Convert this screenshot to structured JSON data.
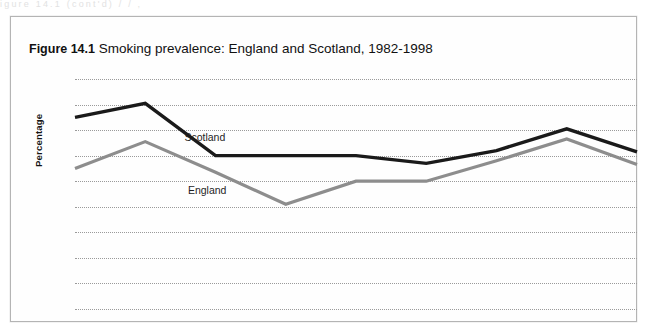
{
  "scan": {
    "top_remnant_text": "igure 14.1  (cont'd)            /                     /                 ,"
  },
  "figure": {
    "number_label": "Figure 14.1",
    "title_text": "Smoking prevalence: England and Scotland, 1982-1998"
  },
  "axes": {
    "y_title": "Percentage",
    "y_ticks": [
      "0",
      "2",
      "4",
      "6",
      "8",
      "10",
      "12",
      "14",
      "16",
      "18"
    ],
    "x_ticks": [
      "1982",
      "1984",
      "1986",
      "1988",
      "1990",
      "1992",
      "1994",
      "1996",
      "1998"
    ]
  },
  "series_labels": {
    "scotland": "Scotland",
    "england": "England"
  },
  "colors": {
    "scotland_line": "#1a1a1a",
    "england_line": "#8d8d8d",
    "gridline": "#9a9a9a",
    "frame_border": "#b4b4b4",
    "page_background": "#ffffff"
  },
  "chart_data": {
    "type": "line",
    "title": "Figure 14.1 Smoking prevalence: England and Scotland, 1982-1998",
    "xlabel": "",
    "ylabel": "Percentage",
    "x": [
      1982,
      1984,
      1986,
      1988,
      1990,
      1992,
      1994,
      1996,
      1998
    ],
    "categories": [
      "1982",
      "1984",
      "1986",
      "1988",
      "1990",
      "1992",
      "1994",
      "1996",
      "1998"
    ],
    "series": [
      {
        "name": "Scotland",
        "color": "#1a1a1a",
        "values": [
          15.0,
          16.1,
          12.0,
          12.0,
          12.0,
          11.4,
          12.4,
          14.1,
          12.3
        ]
      },
      {
        "name": "England",
        "color": "#8d8d8d",
        "values": [
          11.0,
          13.1,
          10.7,
          8.2,
          10.0,
          10.0,
          11.6,
          13.3,
          11.3
        ]
      }
    ],
    "ylim": [
      0,
      18
    ],
    "ytick_step": 2,
    "xlim": [
      1982,
      1998
    ],
    "xtick_step": 2,
    "grid": "horizontal-dotted",
    "legend": "inline-labels"
  }
}
